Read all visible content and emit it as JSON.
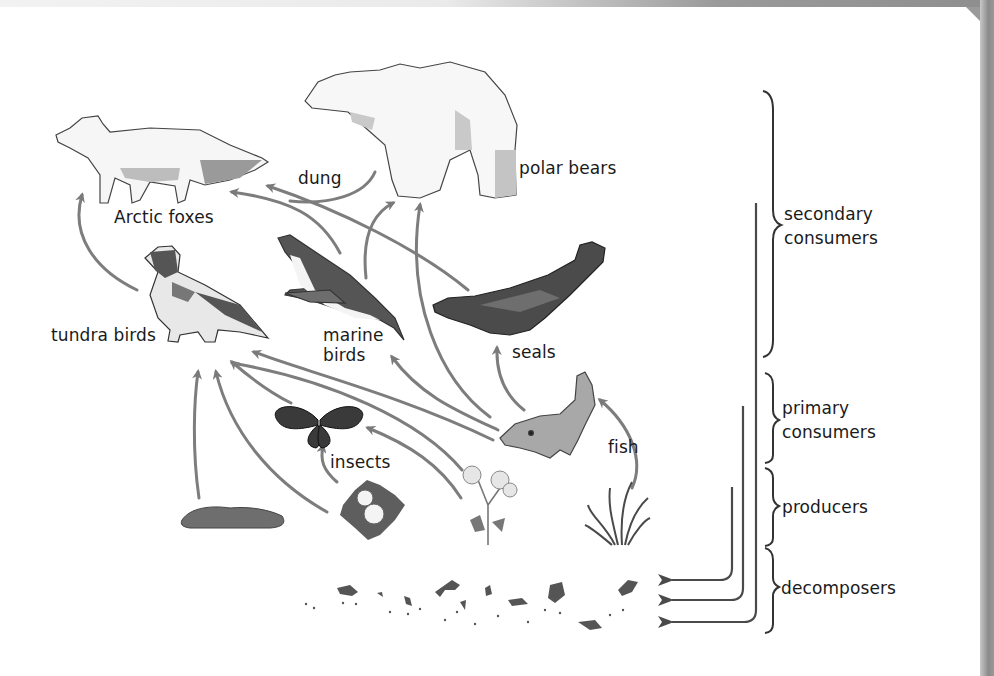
{
  "diagram": {
    "type": "food-web",
    "organisms": {
      "arctic_foxes": "Arctic foxes",
      "polar_bears": "polar bears",
      "dung": "dung",
      "tundra_birds": "tundra birds",
      "marine_birds_line1": "marine",
      "marine_birds_line2": "birds",
      "seals": "seals",
      "insects": "insects",
      "fish": "fish"
    },
    "trophic_levels": {
      "secondary_line1": "secondary",
      "secondary_line2": "consumers",
      "primary_line1": "primary",
      "primary_line2": "consumers",
      "producers": "producers",
      "decomposers": "decomposers"
    },
    "unlabeled_producers": [
      "moss/lichen",
      "white flower",
      "poppy",
      "grass"
    ],
    "edges": [
      {
        "from": "tundra birds",
        "to": "Arctic foxes"
      },
      {
        "from": "marine birds",
        "to": "Arctic foxes"
      },
      {
        "from": "seals",
        "to": "Arctic foxes"
      },
      {
        "from": "polar bears",
        "to": "Arctic foxes",
        "via": "dung"
      },
      {
        "from": "marine birds",
        "to": "polar bears"
      },
      {
        "from": "fish",
        "to": "polar bears"
      },
      {
        "from": "fish",
        "to": "seals"
      },
      {
        "from": "fish",
        "to": "marine birds"
      },
      {
        "from": "fish",
        "to": "tundra birds"
      },
      {
        "from": "insects",
        "to": "tundra birds"
      },
      {
        "from": "moss/lichen",
        "to": "tundra birds"
      },
      {
        "from": "white flower",
        "to": "tundra birds"
      },
      {
        "from": "white flower",
        "to": "insects"
      },
      {
        "from": "poppy",
        "to": "insects"
      },
      {
        "from": "poppy",
        "to": "tundra birds"
      },
      {
        "from": "grass",
        "to": "fish"
      },
      {
        "from": "producers",
        "to": "decomposers"
      },
      {
        "from": "primary consumers",
        "to": "decomposers"
      },
      {
        "from": "secondary consumers",
        "to": "decomposers"
      }
    ],
    "colors": {
      "arrow": "#7a7a7a",
      "arrow_dark": "#4a4a4a",
      "text": "#1a1a1a",
      "dark_animal": "#4b4b4b",
      "mid_animal": "#7d7d7d",
      "light_fill": "#f4f4f4"
    }
  }
}
